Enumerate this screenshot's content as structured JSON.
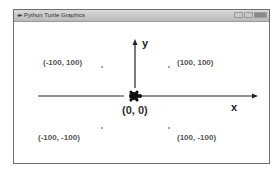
{
  "window": {
    "title": "Python Turtle Graphics",
    "icon": "feather-icon",
    "controls": [
      "minimize",
      "maximize",
      "close"
    ]
  },
  "canvas": {
    "axes": {
      "x_label": "x",
      "y_label": "y"
    },
    "origin_label": "(0, 0)",
    "points": [
      {
        "label": "(-100, 100)",
        "x": -100,
        "y": 100
      },
      {
        "label": "(100, 100)",
        "x": 100,
        "y": 100
      },
      {
        "label": "(-100, -100)",
        "x": -100,
        "y": -100
      },
      {
        "label": "(100, -100)",
        "x": 100,
        "y": -100
      }
    ],
    "turtle": "turtle-icon",
    "colors": {
      "axis": "#222222",
      "label": "#555555",
      "dot": "#888888"
    }
  }
}
